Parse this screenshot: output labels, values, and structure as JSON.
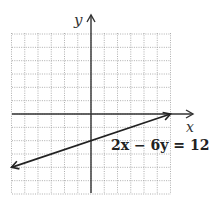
{
  "chart_data": {
    "type": "line",
    "title": "",
    "xlabel": "x",
    "ylabel": "y",
    "xlim": [
      -6,
      6
    ],
    "ylim": [
      -6,
      6
    ],
    "grid": true,
    "grid_style": "dotted",
    "series": [
      {
        "name": "2x − 6y = 12",
        "equation": "2x − 6y = 12",
        "slope": 0.3333,
        "y_intercept": -2,
        "x_intercept": 6,
        "x": [
          -6,
          0,
          6
        ],
        "y": [
          -4,
          -2,
          0
        ],
        "arrows": "both ends"
      }
    ],
    "annotations": [
      {
        "text": "2x − 6y = 12",
        "position": "right of y-axis, below x-axis"
      }
    ]
  },
  "labels": {
    "x_axis": "x",
    "y_axis": "y",
    "equation": "2x − 6y = 12"
  },
  "colors": {
    "grid": "#9a9a9a",
    "axis": "#333333",
    "line": "#222222"
  }
}
